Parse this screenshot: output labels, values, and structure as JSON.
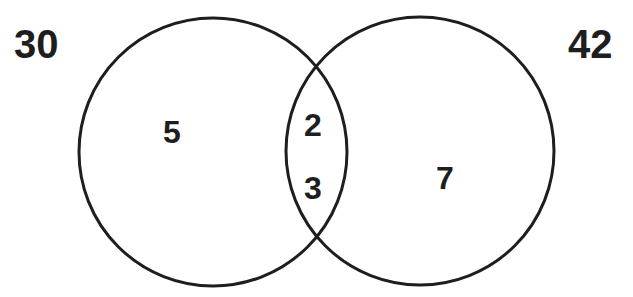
{
  "diagram": {
    "type": "venn",
    "sets": [
      {
        "label": "30",
        "only_region_value": "5"
      },
      {
        "label": "42",
        "only_region_value": "7"
      }
    ],
    "intersection_values": [
      "2",
      "3"
    ],
    "colors": {
      "stroke": "#1e1e1e",
      "text": "#1e1e1e",
      "background": "#ffffff"
    }
  }
}
